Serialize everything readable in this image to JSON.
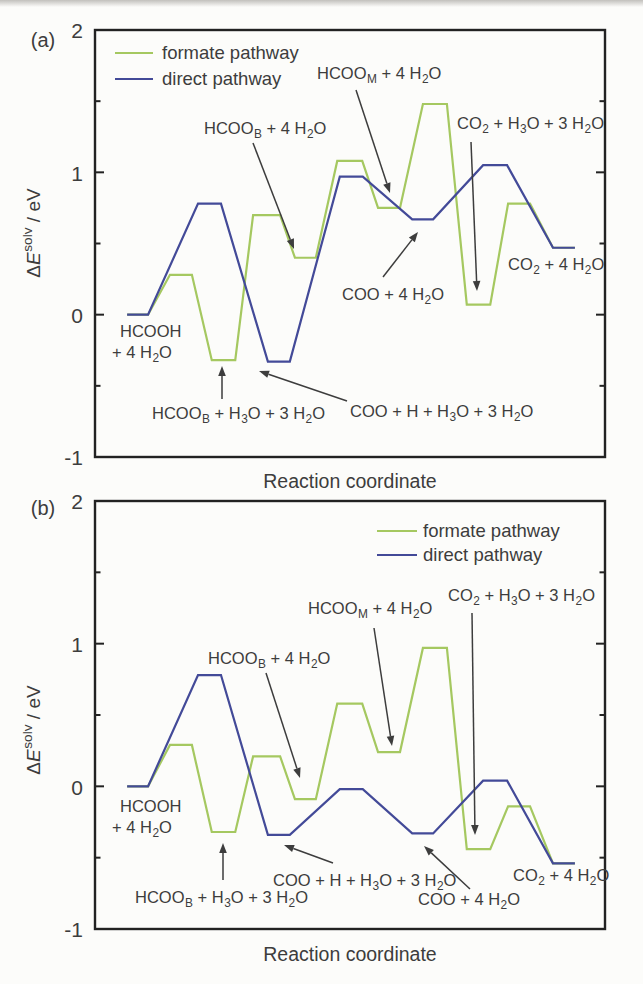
{
  "figure": {
    "width": 643,
    "height": 984,
    "background": "#fcfcfa",
    "text_color": "#3d3d3d",
    "axis_color": "#222222",
    "formate_color": "#a5c860",
    "direct_color": "#434a98"
  },
  "chart_data": [
    {
      "id": "a",
      "type": "line",
      "panel_label": "(a)",
      "xlabel": "Reaction coordinate",
      "ylabel": "Δ*E*^solv^ / eV",
      "ylim": [
        -1,
        2
      ],
      "yticks": [
        2,
        1,
        0,
        -1
      ],
      "minor_yticks": [
        1.5,
        0.5,
        -0.5
      ],
      "grid": false,
      "legend_position": "top-left",
      "legend": {
        "x": 115,
        "swatch_w": 38,
        "text_x": 162,
        "rows_y": [
          53,
          79
        ],
        "items": [
          {
            "label": "formate pathway",
            "color": "#a5c860"
          },
          {
            "label": "direct pathway",
            "color": "#434a98"
          }
        ]
      },
      "series": [
        {
          "name": "formate pathway",
          "color": "#a5c860",
          "steps": [
            [
              0.063,
              0.104,
              0.0
            ],
            [
              0.147,
              0.19,
              0.28
            ],
            [
              0.229,
              0.275,
              -0.32
            ],
            [
              0.31,
              0.363,
              0.7
            ],
            [
              0.392,
              0.433,
              0.4
            ],
            [
              0.475,
              0.524,
              1.08
            ],
            [
              0.555,
              0.598,
              0.75
            ],
            [
              0.643,
              0.69,
              1.48
            ],
            [
              0.729,
              0.775,
              0.07
            ],
            [
              0.81,
              0.853,
              0.78
            ],
            [
              0.898,
              0.941,
              0.47
            ]
          ]
        },
        {
          "name": "direct pathway",
          "color": "#434a98",
          "steps": [
            [
              0.063,
              0.104,
              0.0
            ],
            [
              0.202,
              0.247,
              0.78
            ],
            [
              0.339,
              0.382,
              -0.33
            ],
            [
              0.48,
              0.525,
              0.97
            ],
            [
              0.622,
              0.663,
              0.67
            ],
            [
              0.761,
              0.808,
              1.05
            ],
            [
              0.898,
              0.941,
              0.47
            ]
          ]
        }
      ],
      "annotations": [
        {
          "name": "hcoom-4h2o",
          "lines": [
            "HCOO~M~ + 4 H~2~O"
          ],
          "x": 317,
          "y": 73,
          "arrow": [
            356,
            90,
            390,
            193
          ]
        },
        {
          "name": "hcoob-4h2o",
          "lines": [
            "HCOO~B~ + 4 H~2~O"
          ],
          "x": 204,
          "y": 128,
          "arrow": [
            253,
            143,
            294,
            249
          ]
        },
        {
          "name": "co2-h3o-3h2o",
          "lines": [
            "CO~2~ + H~3~O + 3 H~2~O"
          ],
          "x": 457,
          "y": 123,
          "arrow": [
            471,
            142,
            477,
            291
          ]
        },
        {
          "name": "coo-4h2o",
          "lines": [
            "COO + 4 H~2~O"
          ],
          "x": 342,
          "y": 294,
          "arrow": [
            383,
            277,
            418,
            232
          ]
        },
        {
          "name": "hcooh-4h2o",
          "lines": [
            "HCOOH",
            "+ 4 H~2~O"
          ],
          "indents": [
            8,
            0
          ],
          "x": 112,
          "y": 331
        },
        {
          "name": "hcoob-h3o-3h2o",
          "lines": [
            "HCOO~B~ + H~3~O + 3 H~2~O"
          ],
          "x": 152,
          "y": 413,
          "arrow": [
            222,
            399,
            222,
            366
          ]
        },
        {
          "name": "coo-h-h3o-3h2o",
          "lines": [
            "COO + H + H~3~O + 3 H~2~O"
          ],
          "x": 350,
          "y": 411,
          "arrow": [
            347,
            401,
            259,
            371
          ]
        },
        {
          "name": "co2-4h2o",
          "lines": [
            "CO~2~ + 4 H~2~O"
          ],
          "x": 508,
          "y": 264
        }
      ]
    },
    {
      "id": "b",
      "type": "line",
      "panel_label": "(b)",
      "xlabel": "Reaction coordinate",
      "ylabel": "Δ*E*^solv^ / eV",
      "ylim": [
        -1,
        2
      ],
      "yticks": [
        2,
        1,
        0,
        -1
      ],
      "minor_yticks": [
        1.5,
        0.5,
        -0.5
      ],
      "grid": false,
      "legend_position": "top-right",
      "legend": {
        "x": 377,
        "swatch_w": 40,
        "text_x": 423,
        "rows_y": [
          531,
          555
        ],
        "items": [
          {
            "label": "formate pathway",
            "color": "#a5c860"
          },
          {
            "label": "direct pathway",
            "color": "#434a98"
          }
        ]
      },
      "series": [
        {
          "name": "formate pathway",
          "color": "#a5c860",
          "steps": [
            [
              0.063,
              0.104,
              0.0
            ],
            [
              0.147,
              0.19,
              0.29
            ],
            [
              0.229,
              0.275,
              -0.32
            ],
            [
              0.31,
              0.363,
              0.21
            ],
            [
              0.392,
              0.433,
              -0.09
            ],
            [
              0.475,
              0.524,
              0.58
            ],
            [
              0.555,
              0.598,
              0.24
            ],
            [
              0.643,
              0.69,
              0.97
            ],
            [
              0.729,
              0.775,
              -0.44
            ],
            [
              0.81,
              0.853,
              -0.14
            ],
            [
              0.898,
              0.941,
              -0.54
            ]
          ]
        },
        {
          "name": "direct pathway",
          "color": "#434a98",
          "steps": [
            [
              0.063,
              0.104,
              0.0
            ],
            [
              0.202,
              0.247,
              0.78
            ],
            [
              0.339,
              0.382,
              -0.34
            ],
            [
              0.48,
              0.525,
              -0.02
            ],
            [
              0.622,
              0.663,
              -0.33
            ],
            [
              0.761,
              0.808,
              0.04
            ],
            [
              0.898,
              0.941,
              -0.54
            ]
          ]
        }
      ],
      "annotations": [
        {
          "name": "co2-h3o-3h2o",
          "lines": [
            "CO~2~ + H~3~O + 3 H~2~O"
          ],
          "x": 448,
          "y": 595,
          "arrow": [
            472,
            613,
            475,
            835
          ]
        },
        {
          "name": "hcoom-4h2o",
          "lines": [
            "HCOO~M~ + 4 H~2~O"
          ],
          "x": 308,
          "y": 608,
          "arrow": [
            374,
            628,
            392,
            746
          ]
        },
        {
          "name": "hcoob-4h2o",
          "lines": [
            "HCOO~B~ + 4 H~2~O"
          ],
          "x": 208,
          "y": 658,
          "arrow": [
            266,
            673,
            300,
            778
          ]
        },
        {
          "name": "hcooh-4h2o",
          "lines": [
            "HCOOH",
            "+ 4 H~2~O"
          ],
          "indents": [
            8,
            0
          ],
          "x": 112,
          "y": 806
        },
        {
          "name": "hcoob-h3o-3h2o",
          "lines": [
            "HCOO~B~ + H~3~O + 3 H~2~O"
          ],
          "x": 135,
          "y": 897,
          "arrow": [
            223,
            880,
            223,
            843
          ]
        },
        {
          "name": "coo-h-h3o-3h2o",
          "lines": [
            "COO + H + H~3~O + 3 H~2~O"
          ],
          "x": 273,
          "y": 880,
          "arrow": [
            333,
            863,
            284,
            845
          ]
        },
        {
          "name": "coo-4h2o",
          "lines": [
            "COO + 4 H~2~O"
          ],
          "x": 418,
          "y": 899,
          "arrow": [
            470,
            889,
            424,
            846
          ]
        },
        {
          "name": "co2-4h2o",
          "lines": [
            "CO~2~ + 4 H~2~O"
          ],
          "x": 513,
          "y": 875
        }
      ]
    }
  ]
}
